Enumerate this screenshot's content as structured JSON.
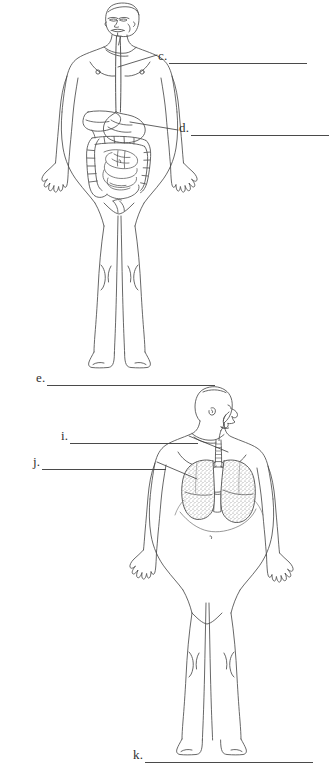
{
  "page": {
    "kind": "anatomy-labeling-worksheet",
    "background_color": "#ffffff",
    "ink_color": "#3a3a3a",
    "rule_color": "#4a4a4a"
  },
  "figures": [
    {
      "id": "upper-figure",
      "name": "digestive-system-figure",
      "description": "Front view outline of a standing human male body with the digestive tract drawn in: esophagus from mouth, stomach, liver, small intestine and large intestine",
      "organs": [
        "esophagus",
        "stomach",
        "liver",
        "small intestine",
        "large intestine"
      ]
    },
    {
      "id": "lower-figure",
      "name": "respiratory-system-figure",
      "description": "Front view outline of a standing human male body with head turned in profile, showing nasal cavity, pharynx, trachea, bronchi and two stippled lungs",
      "organs": [
        "nasal cavity",
        "pharynx",
        "trachea",
        "bronchi",
        "lungs",
        "diaphragm"
      ]
    }
  ],
  "callouts": [
    {
      "key": "c",
      "letter": "c.",
      "answer": "",
      "placeholder": ""
    },
    {
      "key": "d",
      "letter": "d.",
      "answer": "",
      "placeholder": ""
    },
    {
      "key": "e",
      "letter": "e.",
      "answer": "",
      "placeholder": ""
    },
    {
      "key": "i",
      "letter": "i.",
      "answer": "",
      "placeholder": ""
    },
    {
      "key": "j",
      "letter": "j.",
      "answer": "",
      "placeholder": ""
    },
    {
      "key": "k",
      "letter": "k.",
      "answer": "",
      "placeholder": ""
    }
  ]
}
